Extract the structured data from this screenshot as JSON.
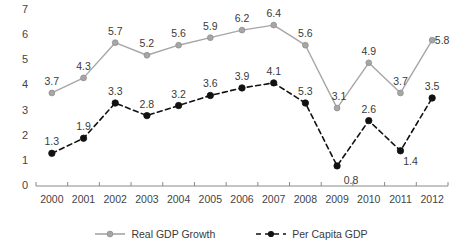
{
  "chart_data": {
    "type": "line",
    "title": "",
    "subtitle": "",
    "xlabel": "",
    "ylabel": "",
    "categories": [
      "2000",
      "2001",
      "2002",
      "2003",
      "2004",
      "2005",
      "2006",
      "2007",
      "2008",
      "2009",
      "2010",
      "2011",
      "2012"
    ],
    "ylim": [
      0,
      7
    ],
    "yticks": [
      0,
      1,
      2,
      3,
      4,
      5,
      6,
      7
    ],
    "ytick_labels": [
      "0",
      "1",
      "2",
      "3",
      "4",
      "5",
      "6",
      "7"
    ],
    "grid": false,
    "legend_position": "bottom-center",
    "series": [
      {
        "name": "Real GDP Growth",
        "color": "#a6a6a6",
        "line_style": "solid",
        "marker": "circle",
        "values": [
          3.7,
          4.3,
          5.7,
          5.2,
          5.6,
          5.9,
          6.2,
          6.4,
          5.6,
          3.1,
          4.9,
          3.7,
          5.8
        ],
        "data_labels": [
          "3.7",
          "4.3",
          "5.7",
          "5.2",
          "5.6",
          "5.9",
          "6.2",
          "6.4",
          "5.6",
          "3.1",
          "4.9",
          "3.7",
          "5.8"
        ]
      },
      {
        "name": "Per Capita GDP",
        "color": "#111111",
        "line_style": "dashed",
        "marker": "circle-filled",
        "values": [
          1.3,
          1.9,
          3.3,
          2.8,
          3.2,
          3.6,
          3.9,
          4.1,
          3.3,
          0.8,
          2.6,
          1.4,
          3.5
        ],
        "data_labels": [
          "1.3",
          "1.9",
          "3.3",
          "2.8",
          "3.2",
          "3.6",
          "3.9",
          "4.1",
          "5.3",
          "0.8",
          "2.6",
          "1.4",
          "3.5"
        ]
      }
    ]
  },
  "legend": {
    "items": [
      {
        "label": "Real GDP Growth"
      },
      {
        "label": "Per Capita GDP"
      }
    ]
  }
}
